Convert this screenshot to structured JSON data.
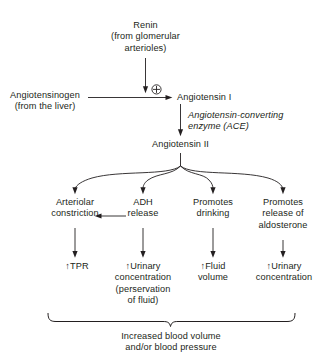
{
  "diagram": {
    "background_color": "#ffffff",
    "line_color": "#231f20",
    "text_color": "#231f20",
    "nodes": {
      "renin": "Renin\n(from glomerular\narterioles)",
      "angiotensinogen": "Angiotensinogen\n(from the liver)",
      "plus_symbol": "⊕",
      "angiotensin_1": "Angiotensin I",
      "ace_enzyme": "Angiotensin-converting\nenzyme (ACE)",
      "angiotensin_2": "Angiotensin II",
      "effect_1": "Arteriolar\nconstriction",
      "effect_2": "ADH\nrelease",
      "effect_3": "Promotes\ndrinking",
      "effect_4": "Promotes\nrelease of\naldosterone",
      "outcome_1": "↑TPR",
      "outcome_2": "↑Urinary\nconcentration\n(perservation\nof fluid)",
      "outcome_3": "↑Fluid\nvolume",
      "outcome_4": "↑Urinary\nconcentration",
      "summary": "Increased blood volume\nand/or blood pressure"
    }
  }
}
